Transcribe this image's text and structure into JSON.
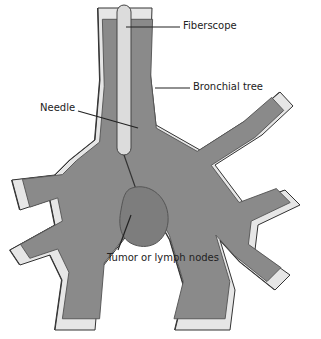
{
  "diagram": {
    "type": "anatomical illustration",
    "labels": [
      {
        "id": "fiberscope",
        "text": "Fiberscope"
      },
      {
        "id": "bronchial_tree",
        "text": "Bronchial tree"
      },
      {
        "id": "needle",
        "text": "Needle"
      },
      {
        "id": "tumor",
        "text": "Tumor or lymph nodes"
      }
    ],
    "colors": {
      "airway_fill": "#8a8a8a",
      "airway_edge": "#333333",
      "wall_highlight": "#e6e6e6",
      "fiberscope": "#dcdcdc",
      "tumor": "#7d7d7d",
      "tumor_edge": "#555555"
    }
  }
}
